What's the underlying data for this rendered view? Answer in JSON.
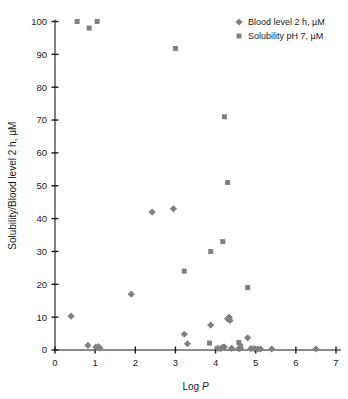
{
  "chart_data": {
    "type": "scatter",
    "title": "",
    "xlabel": "Log P",
    "ylabel": "Solubility/Blood level 2 h, µM",
    "xlim": [
      0,
      7
    ],
    "ylim": [
      0,
      100
    ],
    "xticks": [
      0,
      1,
      2,
      3,
      4,
      5,
      6,
      7
    ],
    "yticks": [
      0,
      10,
      20,
      30,
      40,
      50,
      60,
      70,
      80,
      90,
      100
    ],
    "grid": false,
    "legend_position": "top-right",
    "series": [
      {
        "name": "Blood level 2 h, µM",
        "marker": "diamond",
        "color": "#808080",
        "points": [
          [
            0.4,
            10.3
          ],
          [
            0.82,
            1.4
          ],
          [
            1.02,
            0.9
          ],
          [
            1.08,
            1.0
          ],
          [
            1.12,
            0.6
          ],
          [
            1.9,
            17.0
          ],
          [
            2.42,
            42.0
          ],
          [
            2.95,
            43.0
          ],
          [
            3.22,
            4.8
          ],
          [
            3.3,
            1.9
          ],
          [
            3.88,
            7.6
          ],
          [
            4.05,
            0.5
          ],
          [
            4.12,
            0.4
          ],
          [
            4.18,
            0.8
          ],
          [
            4.22,
            0.9
          ],
          [
            4.3,
            9.5
          ],
          [
            4.34,
            10.0
          ],
          [
            4.36,
            9.0
          ],
          [
            4.4,
            0.5
          ],
          [
            4.58,
            0.4
          ],
          [
            4.62,
            0.6
          ],
          [
            4.8,
            3.7
          ],
          [
            4.88,
            0.4
          ],
          [
            4.96,
            0.4
          ],
          [
            5.05,
            0.3
          ],
          [
            5.12,
            0.3
          ],
          [
            5.4,
            0.3
          ],
          [
            6.5,
            0.3
          ]
        ]
      },
      {
        "name": "Solubility pH 7, µM",
        "marker": "square",
        "color": "#808080",
        "points": [
          [
            0.55,
            100.0
          ],
          [
            0.85,
            98.0
          ],
          [
            1.05,
            100.0
          ],
          [
            3.0,
            91.8
          ],
          [
            3.22,
            24.0
          ],
          [
            3.88,
            30.0
          ],
          [
            3.85,
            2.1
          ],
          [
            4.18,
            33.0
          ],
          [
            4.22,
            71.0
          ],
          [
            4.3,
            51.0
          ],
          [
            4.58,
            2.3
          ],
          [
            4.62,
            1.2
          ],
          [
            4.8,
            19.0
          ]
        ]
      }
    ]
  },
  "legend": {
    "items": [
      {
        "label": "Blood level 2 h, µM",
        "marker": "diamond"
      },
      {
        "label": "Solubility pH 7, µM",
        "marker": "square"
      }
    ]
  },
  "axes": {
    "x_title": "Log P",
    "x_title_prefix": "Log ",
    "x_title_var": "P",
    "y_title": "Solubility/Blood level 2 h, µM"
  },
  "colors": {
    "marker": "#808080",
    "axis": "#1a1a1a",
    "background": "#ffffff"
  }
}
